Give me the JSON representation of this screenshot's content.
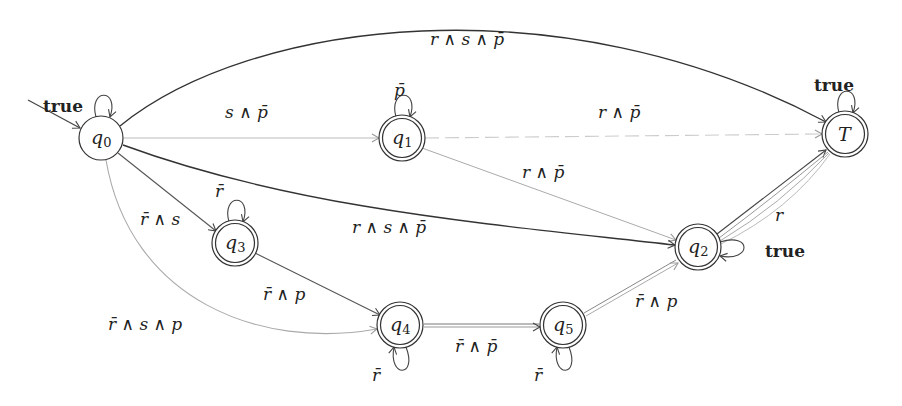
{
  "diagram": {
    "type": "automaton",
    "nodes": [
      {
        "id": "q0",
        "label": "q",
        "sub": "0",
        "x": 101,
        "y": 138,
        "accepting": false,
        "initial": true
      },
      {
        "id": "q1",
        "label": "q",
        "sub": "1",
        "x": 402,
        "y": 138,
        "accepting": true
      },
      {
        "id": "T",
        "label": "T",
        "sub": "",
        "x": 845,
        "y": 134,
        "accepting": true
      },
      {
        "id": "q3",
        "label": "q",
        "sub": "3",
        "x": 235,
        "y": 243,
        "accepting": true
      },
      {
        "id": "q2",
        "label": "q",
        "sub": "2",
        "x": 698,
        "y": 247,
        "accepting": true
      },
      {
        "id": "q4",
        "label": "q",
        "sub": "4",
        "x": 400,
        "y": 325,
        "accepting": true
      },
      {
        "id": "q5",
        "label": "q",
        "sub": "5",
        "x": 563,
        "y": 325,
        "accepting": true
      }
    ],
    "edges": [
      {
        "from": "q0",
        "to": "q0",
        "label": "true",
        "bold": true
      },
      {
        "from": "q0",
        "to": "T",
        "label": "r ∧ s ∧ p̄"
      },
      {
        "from": "q0",
        "to": "q1",
        "label": "s ∧ p̄"
      },
      {
        "from": "q0",
        "to": "q2",
        "label": "r ∧ s ∧ p̄"
      },
      {
        "from": "q0",
        "to": "q3",
        "label": "r̄ ∧ s"
      },
      {
        "from": "q0",
        "to": "q4",
        "label": "r̄ ∧ s ∧ p"
      },
      {
        "from": "q1",
        "to": "q1",
        "label": "p̄"
      },
      {
        "from": "q1",
        "to": "T",
        "label": "r ∧ p̄"
      },
      {
        "from": "q1",
        "to": "q2",
        "label": "r ∧ p̄"
      },
      {
        "from": "q3",
        "to": "q3",
        "label": "r̄"
      },
      {
        "from": "q3",
        "to": "q4",
        "label": "r̄ ∧ p"
      },
      {
        "from": "q4",
        "to": "q4",
        "label": "r̄"
      },
      {
        "from": "q4",
        "to": "q5",
        "label": "r̄ ∧ p̄"
      },
      {
        "from": "q5",
        "to": "q5",
        "label": "r̄"
      },
      {
        "from": "q5",
        "to": "q2",
        "label": "r̄ ∧ p"
      },
      {
        "from": "q2",
        "to": "q2",
        "label": "true",
        "bold": true
      },
      {
        "from": "q2",
        "to": "T",
        "label": "r"
      },
      {
        "from": "T",
        "to": "T",
        "label": "true",
        "bold": true
      }
    ]
  },
  "labels": {
    "q0_self": "true",
    "q0_T": "r ∧ s ∧ p̄",
    "q0_q1": "s ∧ p̄",
    "q0_q2": "r ∧ s ∧ p̄",
    "q0_q3": "r̄ ∧ s",
    "q0_q4": "r̄ ∧ s ∧ p",
    "q1_self": "p̄",
    "q1_T": "r ∧ p̄",
    "q1_q2": "r ∧ p̄",
    "q3_self": "r̄",
    "q3_q4": "r̄ ∧ p",
    "q4_self": "r̄",
    "q4_q5": "r̄ ∧ p̄",
    "q5_self": "r̄",
    "q5_q2": "r̄ ∧ p",
    "q2_self": "true",
    "q2_T": "r",
    "T_self": "true"
  },
  "nodes": {
    "q0": {
      "name": "q",
      "sub": "0"
    },
    "q1": {
      "name": "q",
      "sub": "1"
    },
    "q2": {
      "name": "q",
      "sub": "2"
    },
    "q3": {
      "name": "q",
      "sub": "3"
    },
    "q4": {
      "name": "q",
      "sub": "4"
    },
    "q5": {
      "name": "q",
      "sub": "5"
    },
    "T": {
      "name": "T",
      "sub": ""
    }
  }
}
